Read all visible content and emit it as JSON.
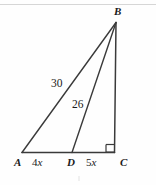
{
  "figure": {
    "background_color": "#fefefe",
    "stroke_color": "#3a3a3a",
    "label_color": "#1a1a1a",
    "vertices": [
      {
        "name": "A",
        "label": "A",
        "x": 22,
        "y": 152,
        "label_x": 14,
        "label_y": 157
      },
      {
        "name": "B",
        "label": "B",
        "x": 116,
        "y": 22,
        "label_x": 114,
        "label_y": 6
      },
      {
        "name": "C",
        "label": "C",
        "x": 114,
        "y": 152,
        "label_x": 120,
        "label_y": 157
      },
      {
        "name": "D",
        "label": "D",
        "x": 72,
        "y": 152,
        "label_x": 67,
        "label_y": 157
      }
    ],
    "segments": [
      {
        "name": "base-AC",
        "from": "A",
        "to": "C"
      },
      {
        "name": "hypotenuse-AB",
        "from": "A",
        "to": "B"
      },
      {
        "name": "cevian-DB",
        "from": "D",
        "to": "B"
      },
      {
        "name": "leg-BC",
        "from": "B",
        "to": "C"
      }
    ],
    "segment_labels": [
      {
        "name": "label-AD",
        "text_prefix": "4",
        "text_var": "x",
        "full": "4x",
        "x": 32,
        "y": 157
      },
      {
        "name": "label-DC",
        "text_prefix": "5",
        "text_var": "x",
        "full": "5x",
        "x": 86,
        "y": 157
      }
    ],
    "length_labels": [
      {
        "name": "length-AB",
        "value": "30",
        "x": 51,
        "y": 78
      },
      {
        "name": "length-DB",
        "value": "26",
        "x": 72,
        "y": 99
      }
    ],
    "right_angle": {
      "name": "right-angle-mark-C",
      "at_vertex": "C",
      "size": 8,
      "x": 106,
      "y": 144
    },
    "artifacts": {
      "top_scan_line_y": 4,
      "bottom_smudge_x": 78,
      "bottom_smudge_y": 176
    }
  }
}
